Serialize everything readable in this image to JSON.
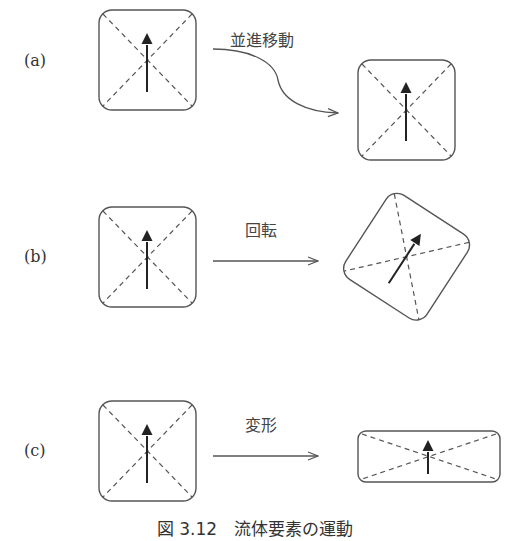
{
  "figure": {
    "caption": "図 3.12　流体要素の運動",
    "rows": [
      {
        "id": "a",
        "label": "(a)",
        "motion": "並進移動"
      },
      {
        "id": "b",
        "label": "(b)",
        "motion": "回転"
      },
      {
        "id": "c",
        "label": "(c)",
        "motion": "変形"
      }
    ]
  },
  "colors": {
    "line": "#555555",
    "arrow": "#222222",
    "text": "#333333",
    "background": "#ffffff"
  }
}
